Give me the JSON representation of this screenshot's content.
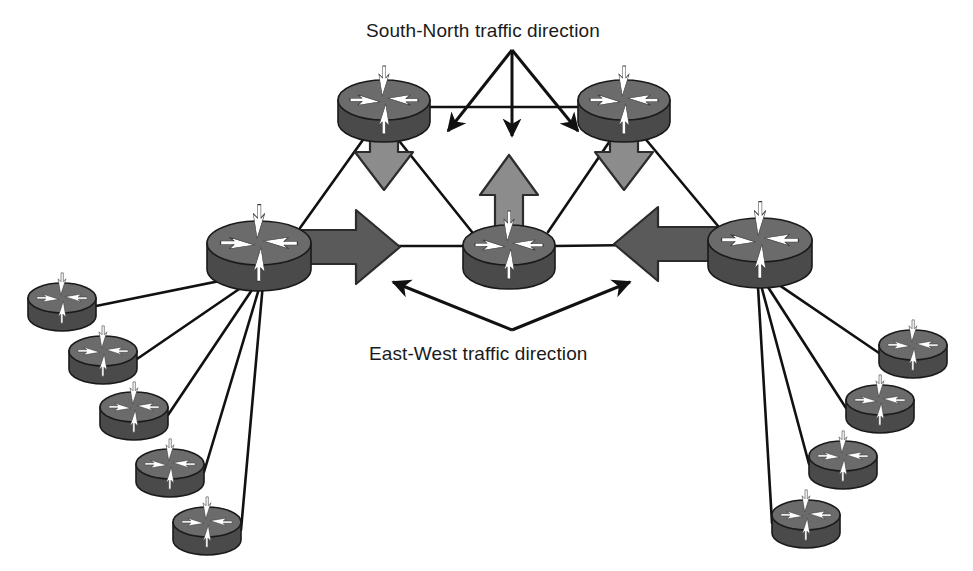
{
  "figure": {
    "type": "network-topology-diagram",
    "background_color": "#ffffff"
  },
  "annotations": {
    "south_north": {
      "text": "South-North traffic direction",
      "x": 366,
      "y": 20
    },
    "east_west": {
      "text": "East-West traffic direction",
      "x": 369,
      "y": 343
    }
  },
  "colors": {
    "router_body": "#4a4a4a",
    "router_top": "#6b6b6b",
    "router_blade": "#ffffff",
    "router_outline": "#1a1a1a",
    "block_arrow_vertical": "#8c8c8c",
    "block_arrow_horizontal": "#5a5a5a",
    "link_line": "#111111",
    "thin_arrow": "#111111",
    "text": "#1a1a1a"
  },
  "routers": [
    {
      "id": "top-left",
      "name": "top-left-spine-router",
      "cx": 384,
      "cy": 100,
      "rx": 46,
      "ry": 20,
      "body_h": 22,
      "role": "core"
    },
    {
      "id": "top-right",
      "name": "top-right-spine-router",
      "cx": 624,
      "cy": 100,
      "rx": 46,
      "ry": 20,
      "body_h": 22,
      "role": "core"
    },
    {
      "id": "mid-left",
      "name": "left-aggregation-router",
      "cx": 259,
      "cy": 243,
      "rx": 52,
      "ry": 22,
      "body_h": 26,
      "role": "aggregation"
    },
    {
      "id": "mid-center",
      "name": "center-aggregation-router",
      "cx": 509,
      "cy": 245,
      "rx": 46,
      "ry": 20,
      "body_h": 24,
      "role": "aggregation"
    },
    {
      "id": "mid-right",
      "name": "right-aggregation-router",
      "cx": 760,
      "cy": 240,
      "rx": 52,
      "ry": 22,
      "body_h": 26,
      "role": "aggregation"
    },
    {
      "id": "leaf-l1",
      "name": "leaf-router-left-1",
      "cx": 62,
      "cy": 298,
      "rx": 34,
      "ry": 15,
      "body_h": 18,
      "role": "leaf"
    },
    {
      "id": "leaf-l2",
      "name": "leaf-router-left-2",
      "cx": 103,
      "cy": 351,
      "rx": 34,
      "ry": 15,
      "body_h": 18,
      "role": "leaf"
    },
    {
      "id": "leaf-l3",
      "name": "leaf-router-left-3",
      "cx": 134,
      "cy": 407,
      "rx": 34,
      "ry": 15,
      "body_h": 18,
      "role": "leaf"
    },
    {
      "id": "leaf-l4",
      "name": "leaf-router-left-4",
      "cx": 170,
      "cy": 464,
      "rx": 34,
      "ry": 15,
      "body_h": 18,
      "role": "leaf"
    },
    {
      "id": "leaf-l5",
      "name": "leaf-router-left-5",
      "cx": 207,
      "cy": 522,
      "rx": 34,
      "ry": 15,
      "body_h": 18,
      "role": "leaf"
    },
    {
      "id": "leaf-r1",
      "name": "leaf-router-right-1",
      "cx": 913,
      "cy": 345,
      "rx": 34,
      "ry": 15,
      "body_h": 18,
      "role": "leaf"
    },
    {
      "id": "leaf-r2",
      "name": "leaf-router-right-2",
      "cx": 880,
      "cy": 400,
      "rx": 34,
      "ry": 15,
      "body_h": 18,
      "role": "leaf"
    },
    {
      "id": "leaf-r3",
      "name": "leaf-router-right-3",
      "cx": 843,
      "cy": 456,
      "rx": 34,
      "ry": 15,
      "body_h": 18,
      "role": "leaf"
    },
    {
      "id": "leaf-r4",
      "name": "leaf-router-right-4",
      "cx": 806,
      "cy": 515,
      "rx": 34,
      "ry": 15,
      "body_h": 18,
      "role": "leaf"
    }
  ],
  "links": [
    {
      "name": "link-midleft-topleft",
      "x1": 300,
      "y1": 228,
      "x2": 370,
      "y2": 130
    },
    {
      "name": "link-midcenter-topleft",
      "x1": 472,
      "y1": 232,
      "x2": 392,
      "y2": 132
    },
    {
      "name": "link-midcenter-topright",
      "x1": 548,
      "y1": 232,
      "x2": 616,
      "y2": 132
    },
    {
      "name": "link-midright-topright",
      "x1": 718,
      "y1": 226,
      "x2": 638,
      "y2": 130
    },
    {
      "name": "link-midleft-midcenter",
      "x1": 300,
      "y1": 246,
      "x2": 466,
      "y2": 246
    },
    {
      "name": "link-midcenter-midright",
      "x1": 554,
      "y1": 246,
      "x2": 716,
      "y2": 244
    },
    {
      "name": "link-topleft-topright",
      "x1": 430,
      "y1": 107,
      "x2": 580,
      "y2": 107
    },
    {
      "name": "link-midleft-leaf-l1",
      "x1": 264,
      "y1": 272,
      "x2": 96,
      "y2": 306
    },
    {
      "name": "link-midleft-leaf-l2",
      "x1": 264,
      "y1": 272,
      "x2": 137,
      "y2": 359
    },
    {
      "name": "link-midleft-leaf-l3",
      "x1": 264,
      "y1": 272,
      "x2": 168,
      "y2": 415
    },
    {
      "name": "link-midleft-leaf-l4",
      "x1": 264,
      "y1": 272,
      "x2": 204,
      "y2": 472
    },
    {
      "name": "link-midleft-leaf-l5",
      "x1": 264,
      "y1": 272,
      "x2": 241,
      "y2": 530
    },
    {
      "name": "link-midright-leaf-r1",
      "x1": 757,
      "y1": 270,
      "x2": 879,
      "y2": 353
    },
    {
      "name": "link-midright-leaf-r2",
      "x1": 757,
      "y1": 270,
      "x2": 846,
      "y2": 408
    },
    {
      "name": "link-midright-leaf-r3",
      "x1": 757,
      "y1": 270,
      "x2": 809,
      "y2": 464
    },
    {
      "name": "link-midright-leaf-r4",
      "x1": 757,
      "y1": 270,
      "x2": 772,
      "y2": 523
    }
  ],
  "block_arrows": [
    {
      "name": "block-arrow-down-left",
      "direction": "down",
      "cx": 384,
      "top": 104,
      "bottom": 190,
      "shaft_w": 28,
      "head_w": 58,
      "head_h": 38,
      "fill": "#8c8c8c"
    },
    {
      "name": "block-arrow-down-right",
      "direction": "down",
      "cx": 624,
      "top": 104,
      "bottom": 190,
      "shaft_w": 28,
      "head_w": 58,
      "head_h": 38,
      "fill": "#8c8c8c"
    },
    {
      "name": "block-arrow-up-center",
      "direction": "up",
      "cx": 509,
      "top": 155,
      "bottom": 250,
      "shaft_w": 28,
      "head_w": 58,
      "head_h": 40,
      "fill": "#8c8c8c"
    },
    {
      "name": "block-arrow-right-west",
      "direction": "right",
      "cy": 247,
      "left": 281,
      "right": 400,
      "shaft_w": 34,
      "head_w": 44,
      "head_h": 74,
      "fill": "#5a5a5a"
    },
    {
      "name": "block-arrow-left-east",
      "direction": "left",
      "cy": 244,
      "left": 614,
      "right": 742,
      "shaft_w": 34,
      "head_w": 44,
      "head_h": 74,
      "fill": "#5a5a5a"
    }
  ],
  "thin_arrows": {
    "south_north_fan": {
      "name": "south-north-arrow-fan",
      "apex": {
        "x": 512,
        "y": 50
      },
      "tips": [
        {
          "x": 448,
          "y": 131
        },
        {
          "x": 512,
          "y": 136
        },
        {
          "x": 578,
          "y": 131
        }
      ]
    },
    "east_west_fan": {
      "name": "east-west-arrow-fan",
      "apex": {
        "x": 512,
        "y": 330
      },
      "tips": [
        {
          "x": 393,
          "y": 282
        },
        {
          "x": 630,
          "y": 282
        }
      ]
    }
  }
}
